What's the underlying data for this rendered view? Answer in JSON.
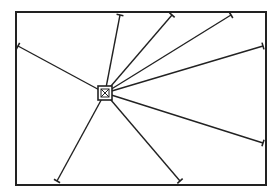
{
  "diagram": {
    "type": "star-network",
    "frame": {
      "x": 16,
      "y": 12,
      "width": 250,
      "height": 173,
      "stroke": "#222222"
    },
    "hub": {
      "cx": 105,
      "cy": 93,
      "size": 14,
      "label": ""
    },
    "spokes": [
      {
        "x": 18,
        "y": 46
      },
      {
        "x": 120,
        "y": 15
      },
      {
        "x": 172,
        "y": 15
      },
      {
        "x": 231,
        "y": 15
      },
      {
        "x": 263,
        "y": 46
      },
      {
        "x": 263,
        "y": 143
      },
      {
        "x": 180,
        "y": 181
      },
      {
        "x": 57,
        "y": 181
      }
    ],
    "line_color": "#222222"
  }
}
